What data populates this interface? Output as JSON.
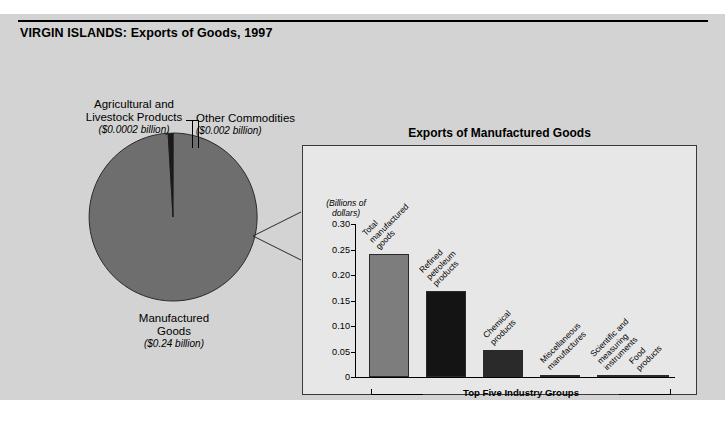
{
  "title": {
    "country": "VIRGIN ISLANDS",
    "separator": ": ",
    "subject": "Exports of Goods, 1997",
    "full": "VIRGIN ISLANDS: Exports of Goods, 1997"
  },
  "colors": {
    "figure_background": "#d3d3d3",
    "panel_background": "#e7e7e7",
    "pie_major_slice": "#6e6e6e",
    "pie_thin_slice": "#1a1a1a",
    "bar_total": "#7d7d7d",
    "bar_dark": "#141414",
    "outline": "#2a2a2a"
  },
  "pie_labels": {
    "agricultural": {
      "name": "Agricultural and Livestock Products",
      "line1": "Agricultural and",
      "line2": "Livestock Products",
      "amount": "($0.0002 billion)"
    },
    "other": {
      "name": "Other Commodities",
      "line1": "Other Commodities",
      "amount": "($0.002 billion)"
    },
    "manufactured": {
      "name": "Manufactured Goods",
      "line1": "Manufactured",
      "line2": "Goods",
      "amount": "($0.24 billion)"
    }
  },
  "panel": {
    "title": "Exports of Manufactured Goods",
    "axis_units_line1": "(Billions of",
    "axis_units_line2": "dollars)",
    "bracket_label": "Top Five Industry Groups"
  },
  "chart_data": [
    {
      "type": "pie",
      "title": "VIRGIN ISLANDS: Exports of Goods, 1997",
      "unit": "billions of dollars",
      "categories": [
        "Manufactured Goods",
        "Other Commodities",
        "Agricultural and Livestock Products"
      ],
      "values": [
        0.24,
        0.002,
        0.0002
      ],
      "value_labels": [
        "($0.24 billion)",
        "($0.002 billion)",
        "($0.0002 billion)"
      ],
      "colors": [
        "#6e6e6e",
        "#1a1a1a",
        "#1a1a1a"
      ],
      "legend": "labels-outside"
    },
    {
      "type": "bar",
      "title": "Exports of Manufactured Goods",
      "xlabel": "Top Five Industry Groups",
      "ylabel": "(Billions of dollars)",
      "ylim": [
        0,
        0.3
      ],
      "yticks": [
        0,
        0.05,
        0.1,
        0.15,
        0.2,
        0.25,
        0.3
      ],
      "ytick_labels": [
        "0",
        "0.05",
        "0.10",
        "0.15",
        "0.20",
        "0.25",
        "0.30"
      ],
      "grid": false,
      "legend": "none",
      "categories": [
        "Total manufactured goods",
        "Refined petroleum products",
        "Chemical products",
        "Miscellaneous manufactures",
        "Scientific and measuring instruments",
        "Food products"
      ],
      "values": [
        0.241,
        0.168,
        0.053,
        0.003,
        0.003,
        0.002
      ],
      "bar_colors": [
        "#7d7d7d",
        "#141414",
        "#2a2a2a",
        "#2a2a2a",
        "#2a2a2a",
        "#2a2a2a"
      ]
    }
  ],
  "bars": [
    {
      "label_line1": "Total",
      "label_line2": "manufactured",
      "label_line3": "goods",
      "value": 0.241,
      "color": "#7d7d7d",
      "left": 14,
      "width": 40
    },
    {
      "label_line1": "Refined",
      "label_line2": "petroleum",
      "label_line3": "products",
      "value": 0.168,
      "color": "#141414",
      "left": 71,
      "width": 40
    },
    {
      "label_line1": "Chemical",
      "label_line2": "products",
      "label_line3": "",
      "value": 0.053,
      "color": "#2a2a2a",
      "left": 128,
      "width": 40
    },
    {
      "label_line1": "Miscellaneous",
      "label_line2": "manufactures",
      "label_line3": "",
      "value": 0.003,
      "color": "#2a2a2a",
      "left": 185,
      "width": 40
    },
    {
      "label_line1": "Scientific and",
      "label_line2": "measuring",
      "label_line3": "instruments",
      "value": 0.003,
      "color": "#2a2a2a",
      "left": 242,
      "width": 40
    },
    {
      "label_line1": "Food",
      "label_line2": "products",
      "label_line3": "",
      "value": 0.002,
      "color": "#2a2a2a",
      "left": 274,
      "width": 40
    }
  ]
}
